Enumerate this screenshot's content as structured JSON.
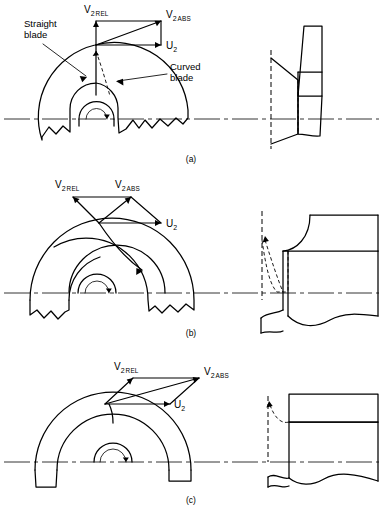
{
  "figure": {
    "background_color": "#ffffff",
    "line_color": "#000000",
    "width": 383,
    "height": 513
  },
  "panels": [
    {
      "id": "a",
      "caption": "(a)",
      "impeller_type": "radial",
      "annotations": [
        {
          "name": "straight-blade",
          "line1": "Straight",
          "line2": "blade"
        },
        {
          "name": "curved-blade",
          "line1": "Curved",
          "line2": "blade"
        }
      ],
      "velocity_triangle": {
        "vectors": [
          {
            "name": "v2-rel",
            "symbol": "V",
            "index": "2",
            "qualifier": "REL",
            "direction": "up"
          },
          {
            "name": "v2-abs",
            "symbol": "V",
            "index": "2",
            "qualifier": "ABS",
            "direction": "up-right"
          },
          {
            "name": "u2",
            "symbol": "U",
            "index": "2",
            "qualifier": "",
            "direction": "right"
          }
        ]
      }
    },
    {
      "id": "b",
      "caption": "(b)",
      "impeller_type": "mixed-flow",
      "annotations": [],
      "velocity_triangle": {
        "vectors": [
          {
            "name": "v2-rel",
            "symbol": "V",
            "index": "2",
            "qualifier": "REL",
            "direction": "up-left"
          },
          {
            "name": "v2-abs",
            "symbol": "V",
            "index": "2",
            "qualifier": "ABS",
            "direction": "up-right"
          },
          {
            "name": "u2",
            "symbol": "U",
            "index": "2",
            "qualifier": "",
            "direction": "right"
          }
        ]
      }
    },
    {
      "id": "c",
      "caption": "(c)",
      "impeller_type": "axial",
      "annotations": [],
      "velocity_triangle": {
        "vectors": [
          {
            "name": "v2-rel",
            "symbol": "V",
            "index": "2",
            "qualifier": "REL",
            "direction": "up-right-steep"
          },
          {
            "name": "v2-abs",
            "symbol": "V",
            "index": "2",
            "qualifier": "ABS",
            "direction": "up-right-long"
          },
          {
            "name": "u2",
            "symbol": "U",
            "index": "2",
            "qualifier": "",
            "direction": "right"
          }
        ]
      }
    }
  ],
  "labels": {
    "v_symbol": "V",
    "u_symbol": "U",
    "index2": "2",
    "rel": "REL",
    "abs": "ABS",
    "straight_line1": "Straight",
    "straight_line2": "blade",
    "curved_line1": "Curved",
    "curved_line2": "blade",
    "caption_a": "(a)",
    "caption_b": "(b)",
    "caption_c": "(c)"
  }
}
